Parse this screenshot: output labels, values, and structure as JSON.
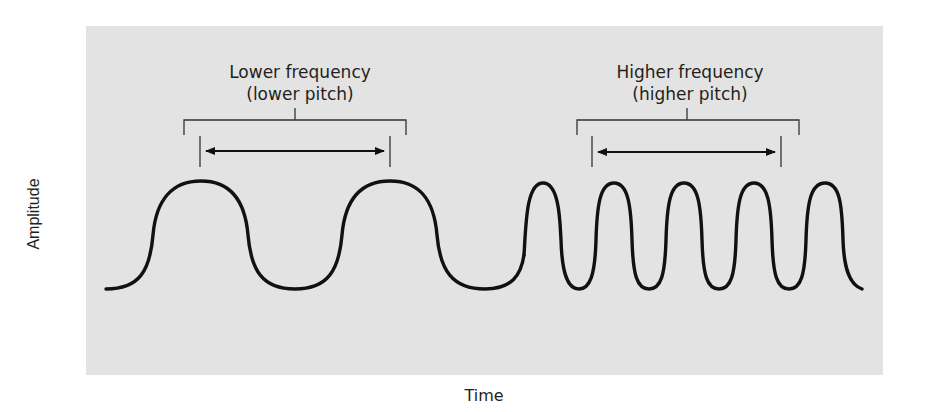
{
  "diagram": {
    "y_axis_label": "Amplitude",
    "x_axis_label": "Time",
    "annotations": [
      {
        "title": "Lower frequency",
        "subtitle": "(lower pitch)"
      },
      {
        "title": "Higher frequency",
        "subtitle": "(higher pitch)"
      }
    ],
    "colors": {
      "panel_background": "#e3e3e3",
      "page_background": "#ffffff",
      "stroke": "#111111",
      "text": "#231f20"
    },
    "waves": [
      {
        "name": "low-frequency-wave",
        "peaks": 2,
        "description": "wide cycles"
      },
      {
        "name": "high-frequency-wave",
        "peaks": 5,
        "description": "narrow cycles"
      }
    ]
  }
}
